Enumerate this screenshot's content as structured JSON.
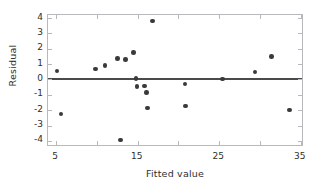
{
  "chart_data": {
    "type": "scatter",
    "title": "",
    "xlabel": "Fitted value",
    "ylabel": "Residual",
    "xlim": [
      4.0,
      35.4
    ],
    "ylim": [
      -4.4,
      4.2
    ],
    "grid": false,
    "legend": null,
    "xticks": [
      5,
      15,
      25,
      35
    ],
    "xtick_labels": [
      "5",
      "15",
      "25",
      "35"
    ],
    "x_minor_ticks": [
      10,
      20,
      30
    ],
    "yticks": [
      4,
      3,
      2,
      1,
      0,
      -1,
      -2,
      -3,
      -4
    ],
    "ytick_labels": [
      "4",
      "3",
      "2",
      "1",
      "0",
      "-1",
      "-2",
      "-3",
      "-4"
    ],
    "reference_line": {
      "orientation": "horizontal",
      "y": 0,
      "color": "#4a4a4a"
    },
    "point_color": "#3a3a3a",
    "points": [
      {
        "x": 5.1,
        "y": 0.55
      },
      {
        "x": 5.6,
        "y": -2.25
      },
      {
        "x": 9.8,
        "y": 0.68
      },
      {
        "x": 11.0,
        "y": 0.92
      },
      {
        "x": 12.5,
        "y": 1.35
      },
      {
        "x": 12.9,
        "y": -3.95
      },
      {
        "x": 13.5,
        "y": 1.32
      },
      {
        "x": 14.5,
        "y": 1.75
      },
      {
        "x": 14.8,
        "y": 0.05
      },
      {
        "x": 14.9,
        "y": -0.45
      },
      {
        "x": 15.8,
        "y": -0.42
      },
      {
        "x": 16.1,
        "y": -0.85
      },
      {
        "x": 16.2,
        "y": -1.85
      },
      {
        "x": 16.8,
        "y": 3.8
      },
      {
        "x": 20.8,
        "y": -0.3
      },
      {
        "x": 20.9,
        "y": -1.72
      },
      {
        "x": 25.4,
        "y": 0.03
      },
      {
        "x": 29.4,
        "y": 0.48
      },
      {
        "x": 31.4,
        "y": 1.5
      },
      {
        "x": 33.6,
        "y": -1.98
      }
    ]
  }
}
